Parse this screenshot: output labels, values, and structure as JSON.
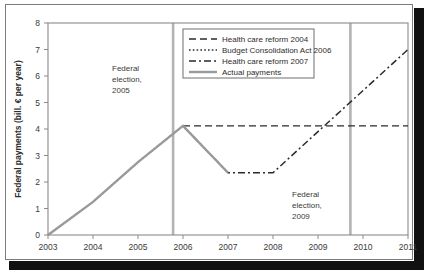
{
  "chart_data": {
    "type": "line",
    "title": "",
    "xlabel": "",
    "ylabel": "Federal payments (bill. € per year)",
    "xlim": [
      2003,
      2011
    ],
    "ylim": [
      0,
      8
    ],
    "xticks": [
      "2003",
      "2004",
      "2005",
      "2006",
      "2007",
      "2008",
      "2009",
      "2010",
      "2011"
    ],
    "yticks": [
      "0",
      "1",
      "2",
      "3",
      "4",
      "5",
      "6",
      "7",
      "8"
    ],
    "grid": false,
    "legend_position": "top-center",
    "series": [
      {
        "name": "Health care reform 2004",
        "style": "dashed",
        "color": "#2b2b2b",
        "x": [
          2006,
          2011
        ],
        "values": [
          4.12,
          4.12
        ]
      },
      {
        "name": "Budget Consolidation Act 2006",
        "style": "dotted",
        "color": "#2b2b2b",
        "x": [
          2003,
          2004,
          2005,
          2006
        ],
        "values": [
          0.0,
          1.25,
          2.75,
          4.12
        ]
      },
      {
        "name": "Health care reform 2007",
        "style": "dash-dot",
        "color": "#2b2b2b",
        "x": [
          2006,
          2007,
          2008,
          2011
        ],
        "values": [
          4.12,
          2.35,
          2.35,
          7.0
        ]
      },
      {
        "name": "Actual payments",
        "style": "solid",
        "color": "#9a9a9a",
        "x": [
          2003,
          2004,
          2005,
          2006,
          2007
        ],
        "values": [
          0.0,
          1.25,
          2.75,
          4.12,
          2.35
        ]
      }
    ],
    "annotations": [
      {
        "text_lines": [
          "Federal",
          "election,",
          "2005"
        ],
        "x": 2005,
        "y": 6.2
      },
      {
        "text_lines": [
          "Federal",
          "election,",
          "2009"
        ],
        "x": 2009,
        "y": 1.45
      }
    ],
    "vertical_lines": [
      {
        "label": "Federal election 2005",
        "x": 2005.78
      },
      {
        "label": "Federal election 2009",
        "x": 2009.72
      }
    ]
  }
}
